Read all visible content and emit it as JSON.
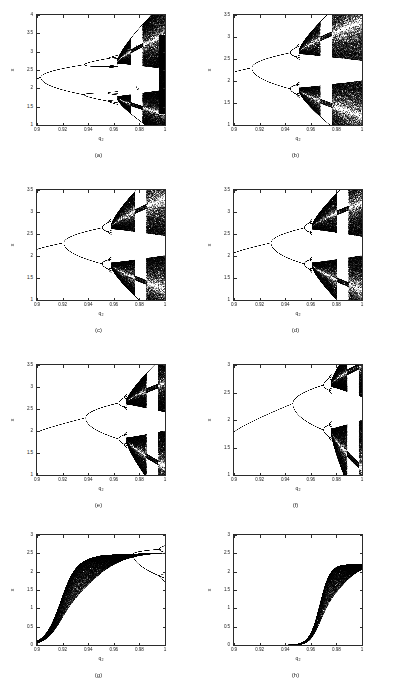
{
  "figure": {
    "background": "#ffffff",
    "axis_color": "#2b2b2b",
    "data_color": "#000000",
    "columns": 2,
    "rows": 4
  },
  "shared": {
    "xlabel": "q",
    "xlabel_sub": "2",
    "ylabel": "x",
    "xticks": [
      "0.9",
      "0.92",
      "0.94",
      "0.96",
      "0.98",
      "1"
    ],
    "xlim": [
      0.9,
      1.0
    ]
  },
  "panels": [
    {
      "caption": "(a)",
      "yticks": [
        "1",
        "1.5",
        "2",
        "2.5",
        "3",
        "3.5",
        "4"
      ],
      "ylim": [
        1,
        4
      ],
      "branch_start": 2.26,
      "first_bifurcation": 0.903,
      "second_bifurcation": 0.937,
      "chaos_onset": 0.963,
      "window_center": 0.978,
      "final_band": [
        1.3,
        3.45
      ],
      "style": "period-doubling-with-windows"
    },
    {
      "caption": "(b)",
      "yticks": [
        "1",
        "1.5",
        "2",
        "2.5",
        "3",
        "3.5"
      ],
      "ylim": [
        1,
        3.5
      ],
      "branch_start": 2.2,
      "first_bifurcation": 0.914,
      "second_bifurcation": 0.944,
      "chaos_onset": 0.951,
      "window_center": 0.972,
      "final_band": [
        1.22,
        3.33
      ],
      "style": "period-doubling-with-windows"
    },
    {
      "caption": "(c)",
      "yticks": [
        "1",
        "1.5",
        "2",
        "2.5",
        "3",
        "3.5"
      ],
      "ylim": [
        1,
        3.5
      ],
      "branch_start": 2.15,
      "first_bifurcation": 0.921,
      "second_bifurcation": 0.951,
      "chaos_onset": 0.958,
      "window_center": 0.981,
      "final_band": [
        1.25,
        3.3
      ],
      "style": "period-doubling-broad-chaos"
    },
    {
      "caption": "(d)",
      "yticks": [
        "1",
        "1.5",
        "2",
        "2.5",
        "3",
        "3.5"
      ],
      "ylim": [
        1,
        3.5
      ],
      "branch_start": 2.07,
      "first_bifurcation": 0.929,
      "second_bifurcation": 0.955,
      "chaos_onset": 0.961,
      "window_center": 0.985,
      "final_band": [
        1.23,
        3.2
      ],
      "style": "period-doubling-with-windows"
    },
    {
      "caption": "(e)",
      "yticks": [
        "1",
        "1.5",
        "2",
        "2.5",
        "3",
        "3.5"
      ],
      "ylim": [
        1,
        3.5
      ],
      "branch_start": 1.97,
      "first_bifurcation": 0.938,
      "second_bifurcation": 0.964,
      "chaos_onset": 0.97,
      "window_center": 0.99,
      "final_band": [
        1.2,
        3.08
      ],
      "style": "period-doubling-with-windows"
    },
    {
      "caption": "(f)",
      "yticks": [
        "1",
        "1.5",
        "2",
        "2.5",
        "3"
      ],
      "ylim": [
        1,
        3
      ],
      "branch_start": 1.78,
      "first_bifurcation": 0.946,
      "second_bifurcation": 0.97,
      "chaos_onset": 0.976,
      "window_center": 0.993,
      "final_band": [
        1.12,
        3.0
      ],
      "style": "period-doubling-with-windows"
    },
    {
      "caption": "(g)",
      "yticks": [
        "0",
        "0.5",
        "1",
        "1.5",
        "2",
        "2.5",
        "3"
      ],
      "ylim": [
        0,
        3
      ],
      "sigmoid_center": 0.918,
      "sigmoid_width": 0.006,
      "plateau": 2.28,
      "transient_band_end": 0.925,
      "first_bifurcation": 0.975,
      "final_band": [
        1.82,
        2.62
      ],
      "style": "transcritical-sigmoid-then-split"
    },
    {
      "caption": "(h)",
      "yticks": [
        "0",
        "0.5",
        "1",
        "1.5",
        "2",
        "2.5",
        "3"
      ],
      "ylim": [
        0,
        3
      ],
      "sigmoid_center": 0.967,
      "sigmoid_width": 0.004,
      "plateau": 2.2,
      "transient_band_end": 0.97,
      "first_bifurcation": null,
      "final_band": [
        2.2,
        2.2
      ],
      "style": "transcritical-sigmoid-stable"
    }
  ]
}
